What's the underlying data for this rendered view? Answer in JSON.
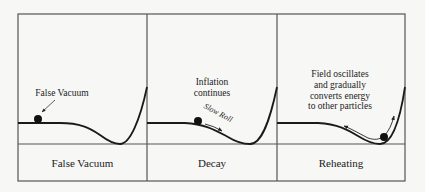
{
  "diagram": {
    "colors": {
      "background": "#f7f7f6",
      "frame": "#555555",
      "curve": "#1a1a1a",
      "text": "#222222"
    },
    "panels": [
      {
        "id": "false-vacuum",
        "caption": "False Vacuum",
        "annotations": [
          "False Vacuum"
        ]
      },
      {
        "id": "decay",
        "caption": "Decay",
        "annotations": [
          "Inflation",
          "continues"
        ],
        "motion_label": "Slow Roll"
      },
      {
        "id": "reheating",
        "caption": "Reheating",
        "annotations": [
          "Field oscillates",
          "and gradually",
          "converts energy",
          "to other particles"
        ]
      }
    ]
  }
}
